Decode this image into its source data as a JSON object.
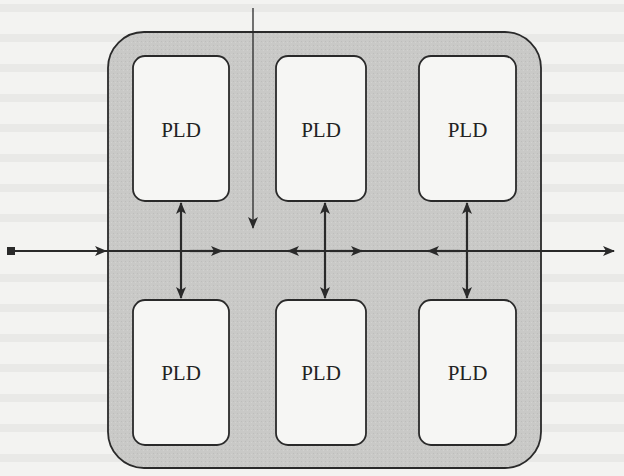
{
  "diagram": {
    "type": "block-diagram",
    "colors": {
      "background": "#f3f3f1",
      "interconnect_fill": "#c8c8c6",
      "pld_fill": "#f6f6f4",
      "stroke": "#2a2a2a"
    },
    "blocks": [
      {
        "id": "pld-top-1",
        "label": "PLD",
        "row": "top",
        "col": 1
      },
      {
        "id": "pld-top-2",
        "label": "PLD",
        "row": "top",
        "col": 2
      },
      {
        "id": "pld-top-3",
        "label": "PLD",
        "row": "top",
        "col": 3
      },
      {
        "id": "pld-bottom-1",
        "label": "PLD",
        "row": "bottom",
        "col": 1
      },
      {
        "id": "pld-bottom-2",
        "label": "PLD",
        "row": "bottom",
        "col": 2
      },
      {
        "id": "pld-bottom-3",
        "label": "PLD",
        "row": "bottom",
        "col": 3
      }
    ],
    "connections": [
      {
        "type": "external-input",
        "from": "left-terminal",
        "to": "interconnect",
        "direction": "right"
      },
      {
        "type": "external-input",
        "from": "top",
        "to": "interconnect",
        "direction": "down"
      },
      {
        "type": "bus-output",
        "from": "interconnect",
        "to": "right-edge",
        "direction": "right"
      },
      {
        "type": "bidirectional",
        "between": [
          "pld-top-1",
          "pld-bottom-1"
        ]
      },
      {
        "type": "bidirectional",
        "between": [
          "pld-top-2",
          "pld-bottom-2"
        ]
      },
      {
        "type": "bidirectional",
        "between": [
          "pld-top-3",
          "pld-bottom-3"
        ]
      }
    ]
  }
}
